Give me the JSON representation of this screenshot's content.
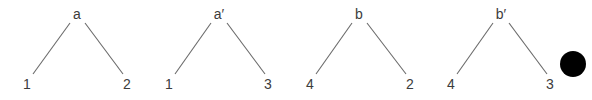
{
  "diagram": {
    "width": 592,
    "height": 100,
    "colors": {
      "edge": "#6a6a6a",
      "label": "#3c3c3c",
      "dot": "#000000",
      "background": "#ffffff"
    },
    "trees": [
      {
        "root": {
          "label": "a",
          "x": 77,
          "y": 19
        },
        "left": {
          "label": "1",
          "x": 27,
          "y": 89
        },
        "right": {
          "label": "2",
          "x": 127,
          "y": 89
        },
        "edges": [
          {
            "x1": 70,
            "y1": 23,
            "x2": 33,
            "y2": 74
          },
          {
            "x1": 85,
            "y1": 23,
            "x2": 123,
            "y2": 74
          }
        ]
      },
      {
        "root": {
          "label": "a′",
          "x": 219,
          "y": 19
        },
        "left": {
          "label": "1",
          "x": 169,
          "y": 89
        },
        "right": {
          "label": "3",
          "x": 268,
          "y": 89
        },
        "edges": [
          {
            "x1": 211,
            "y1": 23,
            "x2": 175,
            "y2": 74
          },
          {
            "x1": 227,
            "y1": 23,
            "x2": 265,
            "y2": 74
          }
        ]
      },
      {
        "root": {
          "label": "b",
          "x": 359,
          "y": 19
        },
        "left": {
          "label": "4",
          "x": 310,
          "y": 89
        },
        "right": {
          "label": "2",
          "x": 410,
          "y": 89
        },
        "edges": [
          {
            "x1": 352,
            "y1": 23,
            "x2": 316,
            "y2": 74
          },
          {
            "x1": 367,
            "y1": 23,
            "x2": 406,
            "y2": 74
          }
        ]
      },
      {
        "root": {
          "label": "b′",
          "x": 501,
          "y": 19
        },
        "left": {
          "label": "4",
          "x": 451,
          "y": 89
        },
        "right": {
          "label": "3",
          "x": 550,
          "y": 89
        },
        "edges": [
          {
            "x1": 493,
            "y1": 23,
            "x2": 457,
            "y2": 74
          },
          {
            "x1": 509,
            "y1": 23,
            "x2": 547,
            "y2": 74
          }
        ]
      }
    ],
    "dot": {
      "cx": 573,
      "cy": 64,
      "r": 13
    }
  }
}
